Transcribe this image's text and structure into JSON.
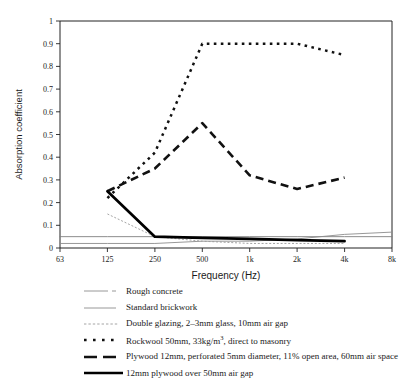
{
  "chart_data": {
    "type": "line",
    "title": "",
    "xlabel": "Frequency (Hz)",
    "ylabel": "Absorption coefficient",
    "categories": [
      "63",
      "125",
      "250",
      "500",
      "1k",
      "2k",
      "4k",
      "8k"
    ],
    "xticklabels": [
      "63",
      "125",
      "250",
      "500",
      "1k",
      "2k",
      "4k",
      "8k"
    ],
    "yticklabels": [
      "0",
      "0.1",
      "0.2",
      "0.3",
      "0.4",
      "0.5",
      "0.6",
      "0.7",
      "0.8",
      "0.9",
      "1"
    ],
    "ylim": [
      0,
      1
    ],
    "ytick_step": 0.1,
    "grid": false,
    "legend_position": "below-plot",
    "series": [
      {
        "name": "Rough concrete",
        "style": "thin-solid-grey",
        "color": "#808080",
        "x": [
          "63",
          "125",
          "250",
          "500",
          "1k",
          "2k",
          "4k",
          "8k"
        ],
        "values": [
          0.05,
          0.05,
          0.05,
          0.05,
          0.05,
          0.05,
          0.05,
          0.05
        ]
      },
      {
        "name": "Standard brickwork",
        "style": "thin-solid-grey",
        "color": "#8c8c8c",
        "x": [
          "63",
          "125",
          "250",
          "500",
          "1k",
          "2k",
          "4k",
          "8k"
        ],
        "values": [
          0.02,
          0.02,
          0.02,
          0.03,
          0.03,
          0.04,
          0.06,
          0.07
        ]
      },
      {
        "name": "Double glazing, 2–3mm glass, 10mm air gap",
        "style": "fine-dotted-grey",
        "color": "#9a9a9a",
        "x": [
          "125",
          "250",
          "500",
          "1k",
          "2k",
          "4k"
        ],
        "values": [
          0.15,
          0.05,
          0.03,
          0.02,
          0.02,
          0.02
        ]
      },
      {
        "name": "Rockwool 50mm, 33kg/m³, direct to masonry",
        "style": "square-dotted-black",
        "color": "#111111",
        "x": [
          "125",
          "250",
          "500",
          "1k",
          "2k",
          "4k"
        ],
        "values": [
          0.22,
          0.42,
          0.9,
          0.9,
          0.9,
          0.85
        ]
      },
      {
        "name": "Plywood 12mm, perforated 5mm diameter, 11% open area, 60mm air space",
        "style": "dashed-black",
        "color": "#111111",
        "x": [
          "125",
          "250",
          "500",
          "1k",
          "2k",
          "4k"
        ],
        "values": [
          0.25,
          0.35,
          0.55,
          0.32,
          0.26,
          0.31
        ]
      },
      {
        "name": "12mm plywood over 50mm air gap",
        "style": "thick-solid-black",
        "color": "#000000",
        "x": [
          "125",
          "250",
          "500",
          "1k",
          "2k",
          "4k"
        ],
        "values": [
          0.25,
          0.05,
          0.045,
          0.04,
          0.035,
          0.03
        ]
      }
    ]
  },
  "axes": {
    "y_title": "Absorption coefficient",
    "x_title": "Frequency (Hz)",
    "yticks": [
      "1",
      "0.9",
      "0.8",
      "0.7",
      "0.6",
      "0.5",
      "0.4",
      "0.3",
      "0.2",
      "0.1",
      "0"
    ],
    "xticks": [
      "63",
      "125",
      "250",
      "500",
      "1k",
      "2k",
      "4k",
      "8k"
    ]
  },
  "legend": {
    "items": [
      {
        "label": "Rough concrete",
        "swatch": "thin-solid-line-swatch"
      },
      {
        "label": "Standard brickwork",
        "swatch": "thin-solid-line-swatch"
      },
      {
        "label": "Double glazing, 2–3mm glass, 10mm air gap",
        "swatch": "fine-dotted-line-swatch"
      },
      {
        "label_pre": "Rockwool 50mm, 33kg/m",
        "label_sup": "3",
        "label_post": ", direct to masonry",
        "label": "Rockwool 50mm, 33kg/m3, direct to masonry",
        "swatch": "square-dotted-line-swatch"
      },
      {
        "label": "Plywood 12mm, perforated 5mm diameter, 11% open area, 60mm air space",
        "swatch": "dashed-line-swatch"
      },
      {
        "label": "12mm plywood over 50mm air gap",
        "swatch": "thick-solid-line-swatch"
      }
    ]
  },
  "colors": {
    "ink": "#111111",
    "grey": "#8c8c8c",
    "background": "#ffffff"
  }
}
